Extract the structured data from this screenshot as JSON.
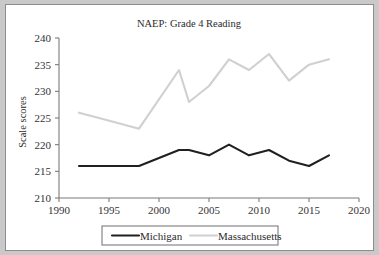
{
  "figure": {
    "background_color": "#ffffff",
    "border_color": "#8d8d8d",
    "page_background": "#c9c9c9"
  },
  "chart_data": {
    "type": "line",
    "title": "NAEP: Grade 4 Reading",
    "xlabel": "",
    "ylabel": "Scale scores",
    "xlim": [
      1990,
      2020
    ],
    "ylim": [
      210,
      240
    ],
    "xticks": [
      1990,
      1995,
      2000,
      2005,
      2010,
      2015,
      2020
    ],
    "xtick_labels": [
      "1990",
      "1995",
      "2000",
      "2005",
      "2010",
      "2015",
      "2020"
    ],
    "yticks": [
      210,
      215,
      220,
      225,
      230,
      235,
      240
    ],
    "ytick_labels": [
      "210",
      "215",
      "220",
      "225",
      "230",
      "235",
      "240"
    ],
    "grid": false,
    "legend_position": "bottom-center",
    "x": [
      1992,
      1994,
      1998,
      2002,
      2003,
      2005,
      2007,
      2009,
      2011,
      2013,
      2015,
      2017
    ],
    "series": [
      {
        "name": "Michigan",
        "color": "#231f20",
        "width": 2.1,
        "values": [
          216,
          216,
          216,
          219,
          219,
          218,
          220,
          218,
          219,
          217,
          216,
          218
        ]
      },
      {
        "name": "Massachusetts",
        "color": "#d0d0d0",
        "width": 2.1,
        "values": [
          226,
          225,
          223,
          234,
          228,
          231,
          236,
          234,
          237,
          232,
          235,
          236
        ]
      }
    ]
  },
  "legend": {
    "items": [
      {
        "label": "Michigan",
        "color": "#231f20"
      },
      {
        "label": "Massachusetts",
        "color": "#d0d0d0"
      }
    ]
  }
}
